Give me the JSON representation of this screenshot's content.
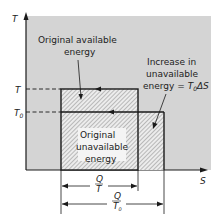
{
  "axes": {
    "y_label": "T",
    "x_label": "S",
    "tick_T": "T",
    "tick_T0": "T",
    "tick_T0_sub": "0"
  },
  "labels": {
    "original_available": [
      "Original available",
      "energy"
    ],
    "increase_unavailable": [
      "Increase in",
      "unavailable",
      "energy = "
    ],
    "increase_formula": "T",
    "increase_formula_sub": "0",
    "increase_formula_tail": "ΔS",
    "original_unavailable": [
      "Original",
      "unavailable",
      "energy"
    ]
  },
  "dimensions": {
    "q_over_t": {
      "num": "Q",
      "den": "T"
    },
    "q_over_t0": {
      "num": "Q",
      "den": "T",
      "den_sub": "0"
    }
  },
  "colors": {
    "background_region": "#d4d4d4",
    "line": "#1a1a1a",
    "hatch": "#555555"
  }
}
